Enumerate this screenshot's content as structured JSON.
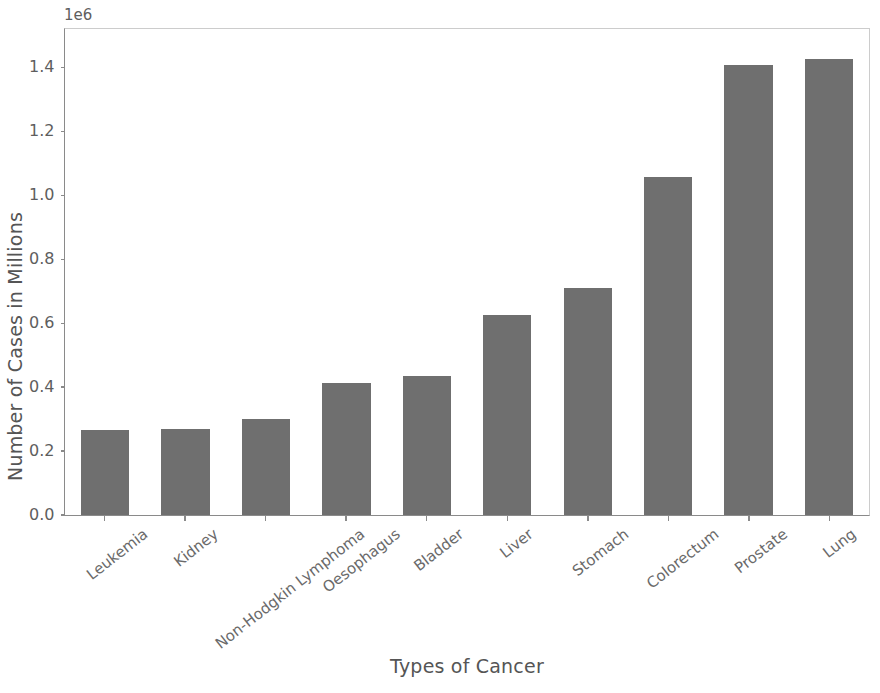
{
  "chart_data": {
    "type": "bar",
    "title": "",
    "xlabel": "Types of Cancer",
    "ylabel": "Number of Cases in Millions",
    "y_offset_text": "1e6",
    "categories": [
      "Leukemia",
      "Kidney",
      "Non-Hodgkin Lymphoma",
      "Oesophagus",
      "Bladder",
      "Liver",
      "Stomach",
      "Colorectum",
      "Prostate",
      "Lung"
    ],
    "values": [
      267000,
      269000,
      300000,
      413000,
      435000,
      626000,
      711000,
      1057000,
      1407000,
      1425000
    ],
    "value_labels": [
      "0.267",
      "0.269",
      "0.300",
      "0.413",
      "0.435",
      "0.626",
      "0.711",
      "1.057",
      "1.407",
      "1.425"
    ],
    "ylim": [
      0,
      1520000
    ],
    "yticks": [
      0,
      200000,
      400000,
      600000,
      800000,
      1000000,
      1200000,
      1400000
    ],
    "ytick_labels": [
      "0.0",
      "0.2",
      "0.4",
      "0.6",
      "0.8",
      "1.0",
      "1.2",
      "1.4"
    ],
    "grid": false,
    "legend": null,
    "bar_color": "#6f6f6f",
    "axis_color": "#8a8a8a",
    "text_color": "#5e5e5e"
  }
}
